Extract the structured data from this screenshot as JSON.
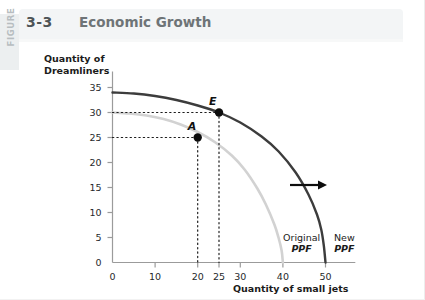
{
  "figure": {
    "vertical_label": "FIGURE",
    "number": "3-3",
    "title": "Economic Growth"
  },
  "chart_data": {
    "type": "line",
    "title": "Economic Growth",
    "xlabel": "Quantity of small jets",
    "ylabel": "Quantity of\nDreamliners",
    "xlim": [
      0,
      57
    ],
    "ylim": [
      0,
      37
    ],
    "grid": false,
    "legend_position": "inside-bottom-right",
    "xticks": [
      0,
      10,
      20,
      25,
      30,
      40,
      50
    ],
    "yticks": [
      0,
      5,
      10,
      15,
      20,
      25,
      30,
      35
    ],
    "series": [
      {
        "name": "Original PPF",
        "color": "#d2d2d2",
        "label_text": "Original\nPPF",
        "x": [
          0,
          4,
          8,
          12,
          16,
          20,
          24,
          28,
          31,
          34,
          36,
          38,
          39,
          39.7,
          40
        ],
        "y": [
          30,
          29.8,
          29.4,
          28.7,
          27.6,
          26.1,
          24.1,
          21.4,
          18.6,
          14.8,
          11.6,
          7.6,
          4.9,
          2.4,
          0
        ]
      },
      {
        "name": "New PPF",
        "color": "#3c3c3c",
        "label_text": "New\nPPF",
        "x": [
          0,
          5,
          10,
          15,
          20,
          25,
          30,
          35,
          39,
          43,
          46,
          48,
          49,
          49.6,
          50
        ],
        "y": [
          34,
          33.8,
          33.3,
          32.5,
          31.4,
          30.0,
          28.0,
          25.2,
          22.2,
          18.0,
          13.6,
          9.6,
          6.6,
          3.4,
          0
        ]
      }
    ],
    "points": [
      {
        "label": "E",
        "x": 25,
        "y": 30,
        "on_series": "New PPF"
      },
      {
        "label": "A",
        "x": 20,
        "y": 25,
        "on_series": "Original PPF"
      }
    ],
    "annotations": [
      {
        "type": "arrow",
        "direction": "right",
        "meaning": "outward-shift"
      }
    ]
  }
}
